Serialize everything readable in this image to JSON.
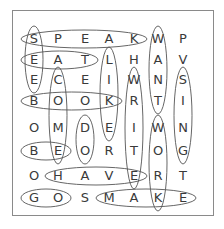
{
  "puzzle": {
    "grid": [
      [
        "S",
        "P",
        "E",
        "A",
        "K",
        "W",
        "P"
      ],
      [
        "E",
        "A",
        "T",
        "L",
        "H",
        "A",
        "V"
      ],
      [
        "E",
        "C",
        "E",
        "I",
        "W",
        "N",
        "S"
      ],
      [
        "B",
        "O",
        "O",
        "K",
        "R",
        "T",
        "I"
      ],
      [
        "O",
        "M",
        "D",
        "E",
        "I",
        "W",
        "N"
      ],
      [
        "B",
        "E",
        "O",
        "R",
        "T",
        "O",
        "G"
      ],
      [
        "O",
        "H",
        "A",
        "V",
        "E",
        "R",
        "T"
      ],
      [
        "G",
        "O",
        "S",
        "M",
        "A",
        "K",
        "E"
      ]
    ],
    "col_x": [
      34,
      58,
      85,
      109,
      134,
      158,
      183
    ],
    "row_y": [
      39,
      60,
      80,
      101,
      128,
      151,
      176,
      198
    ],
    "found_words": [
      {
        "word": "SPEAK",
        "dir": "h",
        "row": 0,
        "from": 0,
        "to": 4
      },
      {
        "word": "SEE",
        "dir": "v",
        "col": 0,
        "from": 0,
        "to": 2
      },
      {
        "word": "EAT",
        "dir": "h",
        "row": 1,
        "from": 0,
        "to": 2
      },
      {
        "word": "LIKE",
        "dir": "v",
        "col": 3,
        "from": 1,
        "to": 4
      },
      {
        "word": "WANT",
        "dir": "v",
        "col": 5,
        "from": 0,
        "to": 3
      },
      {
        "word": "SING",
        "dir": "v",
        "col": 6,
        "from": 2,
        "to": 5
      },
      {
        "word": "BOOK",
        "dir": "h",
        "row": 3,
        "from": 0,
        "to": 3
      },
      {
        "word": "COME",
        "dir": "v",
        "col": 1,
        "from": 2,
        "to": 5
      },
      {
        "word": "WRITE",
        "dir": "v",
        "col": 4,
        "from": 2,
        "to": 6
      },
      {
        "word": "DO",
        "dir": "v",
        "col": 2,
        "from": 4,
        "to": 5
      },
      {
        "word": "BE",
        "dir": "h",
        "row": 5,
        "from": 0,
        "to": 1
      },
      {
        "word": "WORK",
        "dir": "v",
        "col": 5,
        "from": 4,
        "to": 7
      },
      {
        "word": "HAVE",
        "dir": "h",
        "row": 6,
        "from": 1,
        "to": 4
      },
      {
        "word": "GO",
        "dir": "h",
        "row": 7,
        "from": 0,
        "to": 1
      },
      {
        "word": "MAKE",
        "dir": "h",
        "row": 7,
        "from": 3,
        "to": 6
      }
    ],
    "colors": {
      "text": "#3a3a3a",
      "oval": "#555555",
      "frame": "#8a8a8a"
    }
  }
}
